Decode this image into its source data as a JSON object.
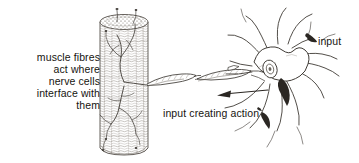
{
  "figure": {
    "background_color": "#ffffff",
    "ink_color": "#3a3632",
    "dark_fill_color": "#2b2723",
    "width": 359,
    "height": 163
  },
  "labels": {
    "muscle": "muscle fibres\nact where\nnerve cells\ninterface with\nthem",
    "action": "input creating action",
    "input": "input"
  },
  "parts": {
    "muscle_fibre": "muscle-fibre-cylinder",
    "muscle_fibre_cap": "muscle-fibre-top-cap",
    "motor_end_plate": "motor-end-plate-branches",
    "axon_segment_left": "myelinated-axon-segment-left",
    "axon_segment_right": "myelinated-axon-segment-right",
    "node_of_ranvier": "node-of-ranvier",
    "neuron_soma": "neuron-cell-body",
    "neuron_nucleus": "neuron-nucleus",
    "dendrites": "neuron-dendrites",
    "synaptic_boutons": "synaptic-bouton-terminals",
    "flow_arrow": "signal-direction-arrow"
  }
}
